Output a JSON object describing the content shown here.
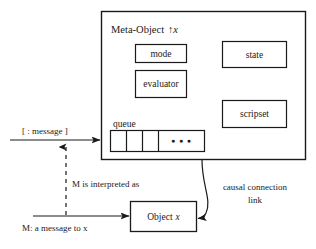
{
  "diagram": {
    "meta_object": {
      "label_prefix": "Meta-Object",
      "label_arrow": "↑",
      "label_var": "x",
      "components": [
        {
          "name": "mode",
          "label": "mode"
        },
        {
          "name": "evaluator",
          "label": "evaluator"
        },
        {
          "name": "state",
          "label": "state"
        },
        {
          "name": "scripset",
          "label": "scripset"
        }
      ],
      "queue": {
        "label": "queue",
        "cells": [
          "",
          "",
          ""
        ],
        "ellipsis": "●  ●  ●"
      }
    },
    "base_object": {
      "label_prefix": "Object",
      "label_var": "x"
    },
    "annotations": {
      "incoming_message": "[ : message ]",
      "interpreted_as": "M is interpreted as",
      "base_message": "M: a message to x",
      "causal_link_line1": "causal connection",
      "causal_link_line2": "link"
    }
  },
  "colors": {
    "stroke": "#1a1a1a",
    "background": "#ffffff",
    "text": "#1a1a1a"
  }
}
